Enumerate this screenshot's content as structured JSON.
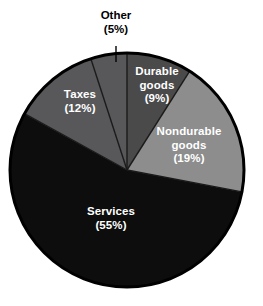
{
  "chart_data": {
    "type": "pie",
    "title": "",
    "subtitle": "",
    "xlabel": "",
    "ylabel": "",
    "legend_position": "none",
    "grid": false,
    "value_unit": "percent",
    "start_angle_deg": 0,
    "direction": "clockwise",
    "categories": [
      "Durable goods",
      "Nondurable goods",
      "Services",
      "Taxes",
      "Other"
    ],
    "values": [
      9,
      19,
      55,
      12,
      5
    ],
    "slices": [
      {
        "name": "Durable goods",
        "label_line_1": "Durable",
        "label_line_2": "goods",
        "label_value": "(9%)",
        "value": 9,
        "color": "#4a4a4a",
        "label_color": "#ffffff",
        "label_placement": "inside",
        "start_deg": 0,
        "end_deg": 32.4
      },
      {
        "name": "Nondurable goods",
        "label_line_1": "Nondurable",
        "label_line_2": "goods",
        "label_value": "(19%)",
        "value": 19,
        "color": "#8d8d8d",
        "label_color": "#ffffff",
        "label_placement": "inside",
        "start_deg": 32.4,
        "end_deg": 100.8
      },
      {
        "name": "Services",
        "label_line_1": "Services",
        "label_line_2": "",
        "label_value": "(55%)",
        "value": 55,
        "color": "#0d0d0d",
        "label_color": "#ffffff",
        "label_placement": "inside",
        "start_deg": 100.8,
        "end_deg": 298.8
      },
      {
        "name": "Taxes",
        "label_line_1": "Taxes",
        "label_line_2": "",
        "label_value": "(12%)",
        "value": 12,
        "color": "#58585a",
        "label_color": "#ffffff",
        "label_placement": "inside",
        "start_deg": 298.8,
        "end_deg": 342.0
      },
      {
        "name": "Other",
        "label_line_1": "Other",
        "label_line_2": "",
        "label_value": "(5%)",
        "value": 5,
        "color": "#58585a",
        "label_color": "#000000",
        "label_placement": "callout-above",
        "start_deg": 342.0,
        "end_deg": 360.0
      }
    ]
  },
  "style": {
    "background": "#ffffff",
    "outline_color": "#000000",
    "separator_color": "#1a1a1a"
  }
}
